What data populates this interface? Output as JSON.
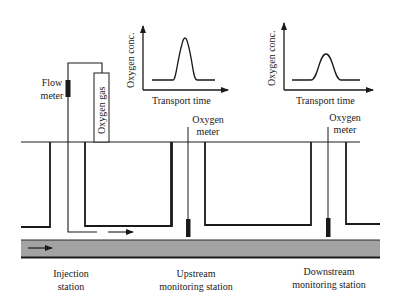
{
  "diagram": {
    "colors": {
      "line": "#1a1a1a",
      "pipe_fill": "#a3a3a3",
      "background": "#ffffff"
    },
    "labels": {
      "flow_meter": [
        "Flow",
        "meter"
      ],
      "oxygen_gas": "Oxygen gas",
      "upstream_meter": [
        "Oxygen",
        "meter"
      ],
      "downstream_meter": [
        "Oxygen",
        "meter"
      ],
      "injection_station": [
        "Injection",
        "station"
      ],
      "upstream_station": [
        "Upstream",
        "monitoring station"
      ],
      "downstream_station": [
        "Downstream",
        "monitoring station"
      ]
    },
    "graphs": [
      {
        "id": "upstream-graph",
        "ylabel": "Oxygen conc.",
        "xlabel": "Transport time",
        "peak": "narrow, tall"
      },
      {
        "id": "downstream-graph",
        "ylabel": "Oxygen conc.",
        "xlabel": "Transport time",
        "peak": "wide, lower"
      }
    ],
    "flow_arrows": [
      "pipe-flow-arrow",
      "injection-flow-arrow"
    ]
  }
}
